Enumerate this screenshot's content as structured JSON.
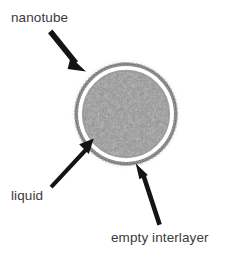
{
  "figure": {
    "type": "labeled-micrograph-schematic",
    "background_color": "#ffffff",
    "width": 228,
    "height": 264
  },
  "annotations": [
    {
      "id": "nanotube",
      "label": "nanotube",
      "icon": "arrow-icon",
      "arrow": {
        "from_x": 53,
        "from_y": 31,
        "to_x": 84,
        "to_y": 69
      },
      "target": "outer dotted wall ring"
    },
    {
      "id": "liquid",
      "label": "liquid",
      "icon": "arrow-icon",
      "arrow": {
        "from_x": 51,
        "from_y": 184,
        "to_x": 92,
        "to_y": 140
      },
      "target": "gray noisy core"
    },
    {
      "id": "empty-interlayer",
      "label": "empty interlayer",
      "icon": "arrow-icon",
      "arrow": {
        "from_x": 159,
        "from_y": 225,
        "to_x": 137,
        "to_y": 165
      },
      "target": "white gap between wall and core"
    }
  ],
  "structure": {
    "center_x": 126,
    "center_y": 114,
    "wall_radius": 51,
    "gap_radius": 46,
    "core_radius": 43,
    "wall_color": "#6e6e6e",
    "gap_color": "#ffffff",
    "core_color": "#8d8d8d",
    "text_color": "#3b3b3b",
    "arrow_color": "#111111"
  }
}
